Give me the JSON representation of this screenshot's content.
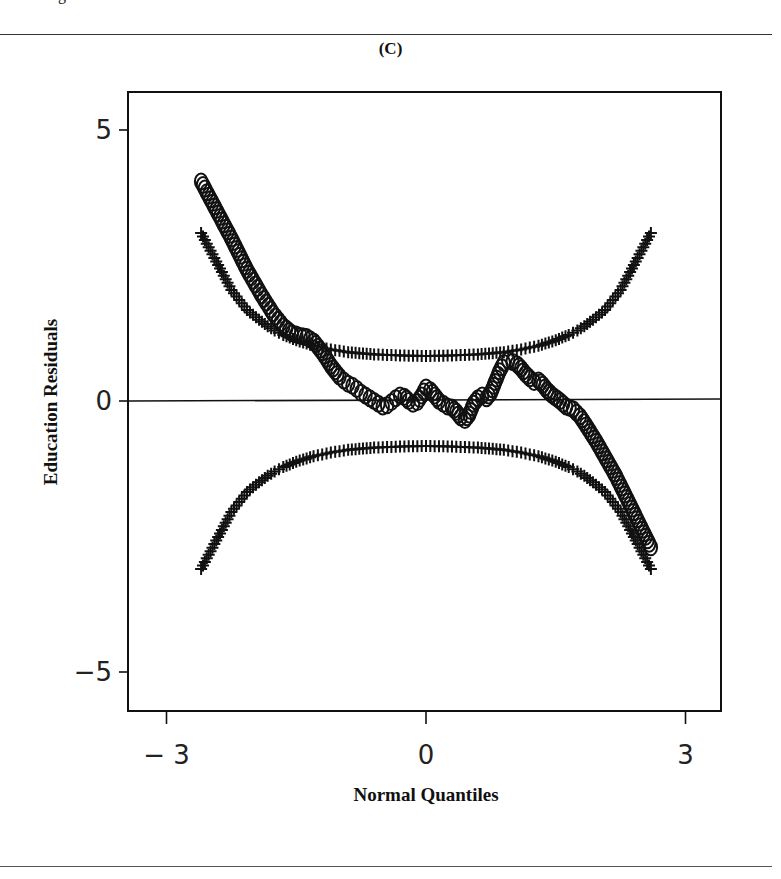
{
  "figure": {
    "panel_label": "(C)",
    "top_text_fragment": "g"
  },
  "chart_data": {
    "type": "scatter",
    "title": "(C)",
    "xlabel": "Normal Quantiles",
    "ylabel": "Education Residuals",
    "xlim": [
      -3.03,
      3.4
    ],
    "ylim": [
      -5.7,
      5.8
    ],
    "xticks": [
      -3,
      0,
      3
    ],
    "xtick_labels": [
      "-3",
      "0",
      "3"
    ],
    "yticks": [
      5,
      0,
      -5
    ],
    "ytick_labels": [
      "5",
      "0",
      "-5"
    ],
    "reference_line": {
      "y": 0
    },
    "grid": false,
    "legend": null,
    "series": [
      {
        "name": "Residuals (O)",
        "marker": "circle",
        "points": [
          [
            -2.6,
            4.05
          ],
          [
            -2.25,
            3.0
          ],
          [
            -2.07,
            2.42
          ],
          [
            -1.9,
            1.95
          ],
          [
            -1.77,
            1.62
          ],
          [
            -1.65,
            1.38
          ],
          [
            -1.55,
            1.25
          ],
          [
            -1.45,
            1.2
          ],
          [
            -1.38,
            1.18
          ],
          [
            -1.3,
            1.1
          ],
          [
            -1.25,
            1.0
          ],
          [
            -1.2,
            0.9
          ],
          [
            -1.15,
            0.78
          ],
          [
            -1.1,
            0.65
          ],
          [
            -1.05,
            0.55
          ],
          [
            -1.0,
            0.45
          ],
          [
            -0.95,
            0.38
          ],
          [
            -0.9,
            0.32
          ],
          [
            -0.85,
            0.28
          ],
          [
            -0.8,
            0.22
          ],
          [
            -0.75,
            0.15
          ],
          [
            -0.7,
            0.1
          ],
          [
            -0.65,
            0.05
          ],
          [
            -0.6,
            0.0
          ],
          [
            -0.55,
            -0.05
          ],
          [
            -0.5,
            -0.1
          ],
          [
            -0.45,
            -0.08
          ],
          [
            -0.4,
            -0.02
          ],
          [
            -0.35,
            0.05
          ],
          [
            -0.3,
            0.1
          ],
          [
            -0.25,
            0.08
          ],
          [
            -0.2,
            0.0
          ],
          [
            -0.15,
            -0.05
          ],
          [
            -0.1,
            -0.02
          ],
          [
            -0.05,
            0.1
          ],
          [
            0.0,
            0.25
          ],
          [
            0.05,
            0.2
          ],
          [
            0.1,
            0.1
          ],
          [
            0.15,
            0.0
          ],
          [
            0.2,
            -0.05
          ],
          [
            0.25,
            -0.1
          ],
          [
            0.3,
            -0.12
          ],
          [
            0.35,
            -0.2
          ],
          [
            0.4,
            -0.3
          ],
          [
            0.45,
            -0.35
          ],
          [
            0.5,
            -0.25
          ],
          [
            0.55,
            -0.05
          ],
          [
            0.6,
            0.05
          ],
          [
            0.65,
            0.1
          ],
          [
            0.7,
            0.05
          ],
          [
            0.75,
            0.15
          ],
          [
            0.8,
            0.35
          ],
          [
            0.85,
            0.55
          ],
          [
            0.9,
            0.7
          ],
          [
            0.95,
            0.75
          ],
          [
            1.0,
            0.72
          ],
          [
            1.05,
            0.68
          ],
          [
            1.1,
            0.6
          ],
          [
            1.15,
            0.5
          ],
          [
            1.2,
            0.42
          ],
          [
            1.25,
            0.35
          ],
          [
            1.3,
            0.38
          ],
          [
            1.35,
            0.3
          ],
          [
            1.4,
            0.2
          ],
          [
            1.45,
            0.12
          ],
          [
            1.55,
            0.0
          ],
          [
            1.62,
            -0.1
          ],
          [
            1.7,
            -0.15
          ],
          [
            1.78,
            -0.28
          ],
          [
            1.85,
            -0.45
          ],
          [
            1.97,
            -0.75
          ],
          [
            2.2,
            -1.4
          ],
          [
            2.6,
            -2.7
          ]
        ]
      },
      {
        "name": "Upper envelope (+)",
        "marker": "plus",
        "points": [
          [
            -2.6,
            3.1
          ],
          [
            -2.25,
            2.05
          ],
          [
            -2.07,
            1.68
          ],
          [
            -1.93,
            1.5
          ],
          [
            -1.83,
            1.38
          ],
          [
            -1.75,
            1.3
          ],
          [
            -1.65,
            1.22
          ],
          [
            -1.5,
            1.12
          ],
          [
            -1.3,
            1.02
          ],
          [
            -1.1,
            0.95
          ],
          [
            -0.9,
            0.9
          ],
          [
            -0.6,
            0.86
          ],
          [
            -0.3,
            0.84
          ],
          [
            0.0,
            0.83
          ],
          [
            0.3,
            0.84
          ],
          [
            0.6,
            0.86
          ],
          [
            0.9,
            0.9
          ],
          [
            1.1,
            0.95
          ],
          [
            1.3,
            1.02
          ],
          [
            1.5,
            1.12
          ],
          [
            1.65,
            1.22
          ],
          [
            1.75,
            1.3
          ],
          [
            1.83,
            1.38
          ],
          [
            1.93,
            1.5
          ],
          [
            2.07,
            1.68
          ],
          [
            2.25,
            2.05
          ],
          [
            2.6,
            3.1
          ]
        ]
      },
      {
        "name": "Lower envelope (+)",
        "marker": "plus",
        "points": [
          [
            -2.6,
            -3.1
          ],
          [
            -2.25,
            -2.05
          ],
          [
            -2.07,
            -1.68
          ],
          [
            -1.93,
            -1.5
          ],
          [
            -1.83,
            -1.38
          ],
          [
            -1.75,
            -1.3
          ],
          [
            -1.65,
            -1.22
          ],
          [
            -1.5,
            -1.12
          ],
          [
            -1.3,
            -1.02
          ],
          [
            -1.1,
            -0.95
          ],
          [
            -0.9,
            -0.9
          ],
          [
            -0.6,
            -0.86
          ],
          [
            -0.3,
            -0.84
          ],
          [
            0.0,
            -0.83
          ],
          [
            0.3,
            -0.84
          ],
          [
            0.6,
            -0.86
          ],
          [
            0.9,
            -0.9
          ],
          [
            1.1,
            -0.95
          ],
          [
            1.3,
            -1.02
          ],
          [
            1.5,
            -1.12
          ],
          [
            1.65,
            -1.22
          ],
          [
            1.75,
            -1.3
          ],
          [
            1.83,
            -1.38
          ],
          [
            1.93,
            -1.5
          ],
          [
            2.07,
            -1.68
          ],
          [
            2.25,
            -2.05
          ],
          [
            2.6,
            -3.1
          ]
        ]
      }
    ]
  }
}
